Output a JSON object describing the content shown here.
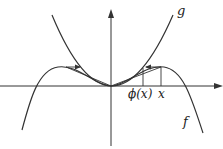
{
  "diagram": {
    "title": "",
    "labels": {
      "g": "g",
      "f": "f",
      "phi_x": "ϕ(x)",
      "x": "x"
    },
    "curves": [
      {
        "name": "g",
        "shape": "parabola opening upward through origin"
      },
      {
        "name": "f",
        "shape": "even quartic-like curve: peaks on both sides, tangent to g at origin, decreasing to -inf"
      }
    ],
    "markers": [
      {
        "name": "phi(x)",
        "position": "vertical segment from x-axis to g"
      },
      {
        "name": "x",
        "position": "vertical segment from x-axis to f"
      }
    ],
    "arrows": [
      {
        "side": "right",
        "direction": "left",
        "from": "f(x) at x",
        "to": "g at phi(x)"
      },
      {
        "side": "left",
        "direction": "right",
        "from": "f peak",
        "to": "g"
      }
    ],
    "colors": {
      "stroke": "#333333",
      "background": "#ffffff"
    }
  }
}
